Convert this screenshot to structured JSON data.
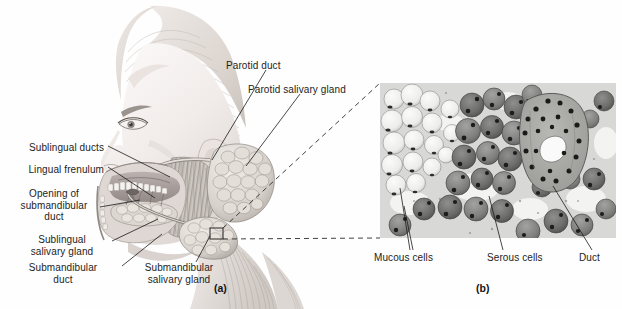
{
  "figure": {
    "background": "#fefefe",
    "width": 622,
    "height": 309
  },
  "panel_a": {
    "caption": "(a)",
    "description": "Lateral view of the head showing the three pairs of salivary glands",
    "labels": [
      {
        "id": "parotid-duct",
        "text": "Parotid duct",
        "x": 226,
        "y": 66,
        "align": "left",
        "leader": [
          [
            265,
            80
          ],
          [
            253,
            140
          ]
        ]
      },
      {
        "id": "parotid-salivary-gland",
        "text": "Parotid salivary gland",
        "x": 248,
        "y": 90,
        "align": "left",
        "leader": [
          [
            286,
            104
          ],
          [
            274,
            153
          ]
        ]
      },
      {
        "id": "sublingual-ducts",
        "text": "Sublingual ducts",
        "x": 104,
        "y": 148,
        "align": "right",
        "leader": [
          [
            106,
            150
          ],
          [
            169,
            176
          ]
        ]
      },
      {
        "id": "lingual-frenulum",
        "text": "Lingual frenulum",
        "x": 104,
        "y": 170,
        "align": "right",
        "leader": [
          [
            106,
            172
          ],
          [
            160,
            196
          ]
        ]
      },
      {
        "id": "opening-of-submandibular-duct",
        "text": "Opening of\nsubmandibular\nduct",
        "x": 94,
        "y": 192,
        "align": "right",
        "leader": [
          [
            96,
            206
          ],
          [
            140,
            201
          ]
        ]
      },
      {
        "id": "sublingual-salivary-gland",
        "text": "Sublingual\nsalivary gland",
        "x": 108,
        "y": 238,
        "align": "right",
        "leader": [
          [
            110,
            244
          ],
          [
            160,
            221
          ]
        ]
      },
      {
        "id": "submandibular-duct",
        "text": "Submandibular\nduct",
        "x": 116,
        "y": 268,
        "align": "right",
        "leader": [
          [
            118,
            272
          ],
          [
            163,
            234
          ]
        ]
      },
      {
        "id": "submandibular-salivary-gland",
        "text": "Submandibular\nsalivary gland",
        "x": 120,
        "y": 268,
        "align": "left",
        "leader": [
          [
            178,
            268
          ],
          [
            205,
            236
          ]
        ]
      }
    ],
    "inset_box": {
      "x": 210,
      "y": 228,
      "width": 13,
      "height": 11
    }
  },
  "panel_b": {
    "caption": "(b)",
    "description": "Light micrograph of a mixed salivary gland showing mucous and serous acini with a duct",
    "micrograph": {
      "x": 380,
      "y": 83,
      "width": 236,
      "height": 155,
      "tone_light": "#f0f0ee",
      "tone_mid": "#9a9a98",
      "tone_dark": "#4a4a4a",
      "stain": "grayscale"
    },
    "labels": [
      {
        "id": "mucous-cells",
        "text": "Mucous cells",
        "x": 375,
        "y": 254,
        "align": "left",
        "leader": [
          [
            412,
            252
          ],
          [
            402,
            214
          ]
        ]
      },
      {
        "id": "serous-cells",
        "text": "Serous cells",
        "x": 487,
        "y": 254,
        "align": "left",
        "leader": [
          [
            502,
            252
          ],
          [
            492,
            196
          ]
        ]
      },
      {
        "id": "duct",
        "text": "Duct",
        "x": 580,
        "y": 254,
        "align": "left",
        "leader": [
          [
            592,
            252
          ],
          [
            553,
            186
          ]
        ]
      }
    ]
  },
  "connector": {
    "type": "magnification-dashed-lines",
    "from_box": {
      "x": 210,
      "y": 228,
      "width": 13,
      "height": 11
    },
    "to_frame": {
      "x": 380,
      "y": 83,
      "width": 236,
      "height": 155
    },
    "dash_pattern": "5 4",
    "color": "#2a2a2a"
  },
  "colors": {
    "text": "#1d1d1d",
    "leader_line": "#1b1b1b",
    "skin_light": "#f7f3f1",
    "skin_shadow": "#d9d2ce",
    "muscle": "#c9c4bf",
    "gland": "#dcd8d4",
    "mucosa": "#b6aeac",
    "background": "#fefefe"
  }
}
